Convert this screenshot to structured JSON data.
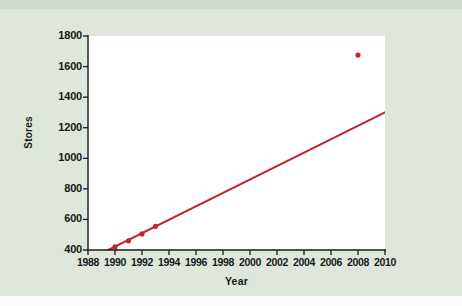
{
  "figure": {
    "background_color": "#dfe7dd",
    "panel_color": "#ffffff",
    "axis_color": "#16191a",
    "series_color": "#c0272d"
  },
  "chart_data": {
    "type": "scatter",
    "title": "",
    "xlabel": "Year",
    "ylabel": "Stores",
    "xlim": [
      1988,
      2010
    ],
    "ylim": [
      400,
      1800
    ],
    "xticks": [
      1988,
      1990,
      1992,
      1994,
      1996,
      1998,
      2000,
      2002,
      2004,
      2006,
      2008,
      2010
    ],
    "xtick_labels": [
      "1988",
      "1990",
      "1992",
      "1994",
      "1996",
      "1998",
      "2000",
      "2002",
      "2004",
      "2006",
      "2008",
      "2010"
    ],
    "yticks": [
      400,
      600,
      800,
      1000,
      1200,
      1400,
      1600,
      1800
    ],
    "ytick_labels": [
      "400",
      "600",
      "800",
      "1000",
      "1200",
      "1400",
      "1600",
      "1800"
    ],
    "grid": false,
    "legend": null,
    "series": [
      {
        "name": "Stores",
        "type": "scatter",
        "color": "#c0272d",
        "marker": "filled-circle",
        "x": [
          1990,
          1991,
          1992,
          1993,
          2008
        ],
        "y": [
          420,
          460,
          505,
          555,
          1675
        ]
      },
      {
        "name": "Least-squares regression line",
        "type": "line",
        "color": "#c0272d",
        "x": [
          1989.5,
          2010
        ],
        "y": [
          400,
          1300
        ]
      }
    ],
    "annotations": [
      {
        "text": "",
        "x": 2008,
        "y": 1675,
        "note": "outlier point far above the fitted line"
      }
    ]
  }
}
